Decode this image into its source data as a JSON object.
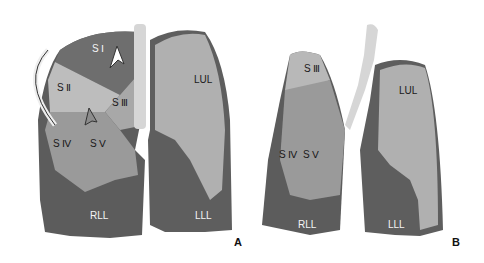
{
  "figure": {
    "panels": [
      {
        "id": "A",
        "labels": {
          "s1": "S Ⅰ",
          "s2": "S Ⅱ",
          "s3": "S Ⅲ",
          "s4": "S Ⅳ",
          "s5": "S Ⅴ",
          "lul": "LUL",
          "rll": "RLL",
          "lll": "LLL"
        }
      },
      {
        "id": "B",
        "labels": {
          "s3": "S Ⅲ",
          "s4": "S Ⅳ",
          "s5": "S Ⅴ",
          "lul": "LUL",
          "rll": "RLL",
          "lll": "LLL"
        }
      }
    ]
  },
  "colors": {
    "dark_lobe": "#5a5a5a",
    "mid_lobe": "#8c8c8c",
    "light_lobe": "#b8b8b8",
    "trachea": "#d8d8d8"
  }
}
